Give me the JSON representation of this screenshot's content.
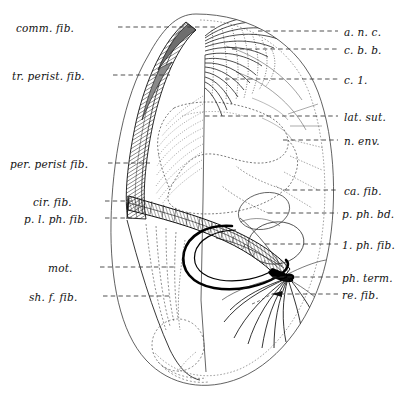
{
  "figure": {
    "type": "anatomical-line-diagram",
    "background_color": "#ffffff",
    "ink_color": "#111111",
    "caption_partial": ""
  },
  "labels_left": [
    {
      "id": "comm-fib",
      "text": "comm. fib.",
      "x": 16,
      "y": 22,
      "leader_x1": 118,
      "leader_x2": 215,
      "leader_y": 27
    },
    {
      "id": "tr-perist-fib",
      "text": "tr. perist. fib.",
      "x": 12,
      "y": 70,
      "leader_x1": 113,
      "leader_x2": 170,
      "leader_y": 75
    },
    {
      "id": "per-perist-fib",
      "text": "per. perist fib.",
      "x": 10,
      "y": 158,
      "leader_x1": 108,
      "leader_x2": 150,
      "leader_y": 163
    },
    {
      "id": "cir-fib",
      "text": "cir. fib.",
      "x": 33,
      "y": 196,
      "leader_x1": 105,
      "leader_x2": 135,
      "leader_y": 201
    },
    {
      "id": "pl-ph-fib",
      "text": "p. l. ph. fib.",
      "x": 24,
      "y": 213,
      "leader_x1": 105,
      "leader_x2": 132,
      "leader_y": 218
    },
    {
      "id": "mot",
      "text": "mot.",
      "x": 48,
      "y": 262,
      "leader_x1": 100,
      "leader_x2": 175,
      "leader_y": 267
    },
    {
      "id": "sh-f-fib",
      "text": "sh. f. fib.",
      "x": 29,
      "y": 291,
      "leader_x1": 103,
      "leader_x2": 172,
      "leader_y": 296
    }
  ],
  "labels_right": [
    {
      "id": "a-n-c",
      "text": "a. n. c.",
      "x": 344,
      "y": 26,
      "leader_x1": 258,
      "leader_x2": 338,
      "leader_y": 31
    },
    {
      "id": "c-b-b",
      "text": "c. b. b.",
      "x": 344,
      "y": 44,
      "leader_x1": 232,
      "leader_x2": 338,
      "leader_y": 49
    },
    {
      "id": "c-1",
      "text": "c. 1.",
      "x": 344,
      "y": 74,
      "leader_x1": 225,
      "leader_x2": 338,
      "leader_y": 79
    },
    {
      "id": "lat-sut",
      "text": "lat. sut.",
      "x": 344,
      "y": 111,
      "leader_x1": 205,
      "leader_x2": 338,
      "leader_y": 116
    },
    {
      "id": "n-env",
      "text": "n. env.",
      "x": 344,
      "y": 135,
      "leader_x1": 283,
      "leader_x2": 338,
      "leader_y": 140
    },
    {
      "id": "ca-fib",
      "text": "ca. fib.",
      "x": 344,
      "y": 185,
      "leader_x1": 285,
      "leader_x2": 338,
      "leader_y": 190
    },
    {
      "id": "p-ph-bd",
      "text": "p. ph. bd.",
      "x": 342,
      "y": 208,
      "leader_x1": 268,
      "leader_x2": 338,
      "leader_y": 213
    },
    {
      "id": "1-ph-fib",
      "text": "1. ph. fib.",
      "x": 342,
      "y": 239,
      "leader_x1": 265,
      "leader_x2": 338,
      "leader_y": 244
    },
    {
      "id": "ph-term",
      "text": "ph. term.",
      "x": 342,
      "y": 272,
      "leader_x1": 272,
      "leader_x2": 338,
      "leader_y": 277
    },
    {
      "id": "re-fib",
      "text": "re. fib.",
      "x": 342,
      "y": 289,
      "leader_x1": 272,
      "leader_x2": 338,
      "leader_y": 294
    }
  ]
}
